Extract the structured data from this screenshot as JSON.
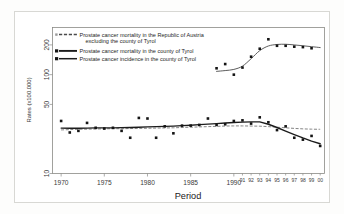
{
  "figure": {
    "background_color": "#ffffff",
    "frame_color": "#8a8a86",
    "ink_color": "#1c1c1c"
  },
  "chart_data": {
    "type": "line",
    "title": "",
    "subtitle": "",
    "xlabel": "Period",
    "ylabel": "Rates (x100.000)",
    "yscale": "log",
    "ylim": [
      10,
      300
    ],
    "xlim": [
      1969,
      2000.5
    ],
    "grid": false,
    "legend_position": "top-left inside axes",
    "ytick_labels": [
      "200",
      "100",
      "50",
      "10"
    ],
    "ytick_values": [
      200,
      100,
      50,
      10
    ],
    "xtick_labels": [
      "1970",
      "1975",
      "1980",
      "1985",
      "1990",
      "91",
      "92",
      "93",
      "94",
      "95",
      "96",
      "97",
      "98",
      "99",
      "00"
    ],
    "xtick_values": [
      1970,
      1975,
      1980,
      1985,
      1990,
      1991,
      1992,
      1993,
      1994,
      1995,
      1996,
      1997,
      1998,
      1999,
      2000
    ],
    "legend": [
      {
        "label": "Prostate cancer mortality in the Republic of Austria excluding the county of Tyrol",
        "label_line1": "Prostate cancer mortality in the Republic of Austria",
        "label_line2": "excluding the county of Tyrol",
        "marker": "small-square-open",
        "line_style": "dashed",
        "color": "#6e6e6e"
      },
      {
        "label": "Prostate cancer mortality in the county of Tyrol",
        "label_line1": "Prostate cancer mortality in the county of Tyrol",
        "label_line2": "",
        "marker": "filled-square",
        "line_style": "solid-thick",
        "color": "#1c1c1c"
      },
      {
        "label": "Prostate cancer incidence in the county of Tyrol",
        "label_line1": "Prostate cancer incidence in the county of Tyrol",
        "label_line2": "",
        "marker": "filled-square",
        "line_style": "solid",
        "color": "#1c1c1c"
      }
    ],
    "series": [
      {
        "name": "Prostate cancer mortality in the Republic of Austria excluding the county of Tyrol",
        "style": "dashed",
        "x": [
          1970,
          1971,
          1972,
          1973,
          1974,
          1975,
          1976,
          1977,
          1978,
          1979,
          1980,
          1981,
          1982,
          1983,
          1984,
          1985,
          1986,
          1987,
          1988,
          1989,
          1990,
          1991,
          1992,
          1993,
          1994,
          1995,
          1996,
          1997,
          1998,
          1999,
          2000
        ],
        "values": [
          27.6,
          27.8,
          28.0,
          28.1,
          28.2,
          28.3,
          28.4,
          28.4,
          28.5,
          28.6,
          28.7,
          28.8,
          28.9,
          29.0,
          29.2,
          29.4,
          29.6,
          29.8,
          30.0,
          30.2,
          30.3,
          30.3,
          30.2,
          30.1,
          29.8,
          29.4,
          29.0,
          28.6,
          28.3,
          28.1,
          28.0
        ]
      },
      {
        "name": "Prostate cancer mortality in the county of Tyrol",
        "style": "solid-thick",
        "x": [
          1970,
          1971,
          1972,
          1973,
          1974,
          1975,
          1976,
          1977,
          1978,
          1979,
          1980,
          1981,
          1982,
          1983,
          1984,
          1985,
          1986,
          1987,
          1988,
          1989,
          1990,
          1991,
          1992,
          1993,
          1994,
          1995,
          1996,
          1997,
          1998,
          1999,
          2000
        ],
        "values": [
          28.8,
          28.7,
          28.7,
          28.8,
          28.9,
          29.0,
          29.0,
          29.1,
          29.2,
          29.4,
          29.6,
          29.8,
          30.0,
          30.2,
          30.5,
          30.8,
          31.2,
          31.6,
          32.0,
          32.4,
          32.8,
          33.1,
          33.3,
          33.3,
          31.5,
          29.2,
          26.9,
          24.8,
          22.9,
          21.3,
          20.0
        ],
        "points": [
          {
            "x": 1970,
            "y": 34.0
          },
          {
            "x": 1971,
            "y": 26.0
          },
          {
            "x": 1972,
            "y": 27.0
          },
          {
            "x": 1973,
            "y": 32.5
          },
          {
            "x": 1974,
            "y": 29.0
          },
          {
            "x": 1975,
            "y": 28.5
          },
          {
            "x": 1976,
            "y": 29.0
          },
          {
            "x": 1977,
            "y": 27.0
          },
          {
            "x": 1978,
            "y": 23.0
          },
          {
            "x": 1979,
            "y": 36.5
          },
          {
            "x": 1980,
            "y": 36.0
          },
          {
            "x": 1981,
            "y": 23.0
          },
          {
            "x": 1982,
            "y": 30.0
          },
          {
            "x": 1983,
            "y": 25.5
          },
          {
            "x": 1984,
            "y": 30.5
          },
          {
            "x": 1985,
            "y": 30.5
          },
          {
            "x": 1986,
            "y": 31.0
          },
          {
            "x": 1987,
            "y": 36.0
          },
          {
            "x": 1988,
            "y": 31.0
          },
          {
            "x": 1989,
            "y": 31.5
          },
          {
            "x": 1990,
            "y": 34.0
          },
          {
            "x": 1991,
            "y": 34.5
          },
          {
            "x": 1992,
            "y": 32.0
          },
          {
            "x": 1993,
            "y": 37.0
          },
          {
            "x": 1994,
            "y": 33.0
          },
          {
            "x": 1995,
            "y": 27.5
          },
          {
            "x": 1996,
            "y": 30.0
          },
          {
            "x": 1997,
            "y": 23.0
          },
          {
            "x": 1998,
            "y": 22.0
          },
          {
            "x": 1999,
            "y": 24.0
          },
          {
            "x": 2000,
            "y": 19.0
          }
        ]
      },
      {
        "name": "Prostate cancer incidence in the county of Tyrol",
        "style": "solid",
        "x": [
          1988,
          1989,
          1990,
          1991,
          1992,
          1993,
          1994,
          1995,
          1996,
          1997,
          1998,
          1999,
          2000
        ],
        "values": [
          108,
          110,
          113,
          122,
          145,
          175,
          195,
          202,
          203,
          200,
          196,
          192,
          188
        ],
        "points": [
          {
            "x": 1988,
            "y": 116
          },
          {
            "x": 1989,
            "y": 128
          },
          {
            "x": 1990,
            "y": 100
          },
          {
            "x": 1991,
            "y": 118
          },
          {
            "x": 1992,
            "y": 152
          },
          {
            "x": 1993,
            "y": 183
          },
          {
            "x": 1994,
            "y": 228
          },
          {
            "x": 1995,
            "y": 196
          },
          {
            "x": 1996,
            "y": 196
          },
          {
            "x": 1997,
            "y": 192
          },
          {
            "x": 1998,
            "y": 190
          },
          {
            "x": 1999,
            "y": 185
          }
        ]
      }
    ]
  }
}
